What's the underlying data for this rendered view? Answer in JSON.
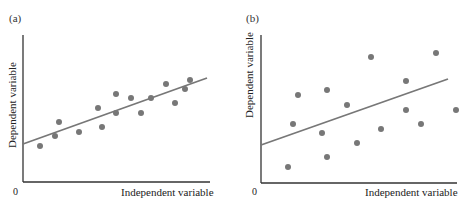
{
  "chart_data": [
    {
      "type": "scatter",
      "panel_label": "(a)",
      "xlabel": "Independent variable",
      "ylabel": "Dependent variable",
      "origin_label": "0",
      "ticks": false,
      "grid": false,
      "point_color": "#777777",
      "line_color": "#777777",
      "axis_color": "#333333",
      "points_px": [
        [
          40,
          146
        ],
        [
          55,
          136
        ],
        [
          59,
          122
        ],
        [
          79,
          132
        ],
        [
          98,
          108
        ],
        [
          102,
          127
        ],
        [
          116,
          94
        ],
        [
          116,
          113
        ],
        [
          131,
          98
        ],
        [
          141,
          113
        ],
        [
          151,
          98
        ],
        [
          166,
          84
        ],
        [
          175,
          103
        ],
        [
          185,
          89
        ],
        [
          190,
          80
        ]
      ],
      "fit_line_px": [
        [
          23,
          144
        ],
        [
          207,
          78
        ]
      ],
      "axes_px": {
        "x0": 23,
        "y0": 182,
        "ytop": 35,
        "xright": 210
      },
      "description": "Points closely clustered around upward-sloping regression line (strong positive correlation)"
    },
    {
      "type": "scatter",
      "panel_label": "(b)",
      "xlabel": "Independent variable",
      "ylabel": "Dependent variable",
      "origin_label": "0",
      "ticks": false,
      "grid": false,
      "point_color": "#777777",
      "line_color": "#777777",
      "axis_color": "#333333",
      "points_px": [
        [
          288,
          167
        ],
        [
          293,
          124
        ],
        [
          298,
          95
        ],
        [
          322,
          133
        ],
        [
          327,
          157
        ],
        [
          327,
          90
        ],
        [
          347,
          105
        ],
        [
          357,
          143
        ],
        [
          371,
          57
        ],
        [
          381,
          129
        ],
        [
          406,
          81
        ],
        [
          406,
          110
        ],
        [
          421,
          124
        ],
        [
          436,
          53
        ],
        [
          456,
          110
        ]
      ],
      "fit_line_px": [
        [
          261,
          145
        ],
        [
          448,
          79
        ]
      ],
      "axes_px": {
        "x0": 261,
        "y0": 183,
        "ytop": 35,
        "xright": 457
      },
      "description": "Points widely scattered around upward-sloping regression line (weak positive correlation)"
    }
  ],
  "panels": {
    "a": {
      "label": "(a)",
      "xlabel": "Independent variable",
      "ylabel": "Dependent variable",
      "origin": "0"
    },
    "b": {
      "label": "(b)",
      "xlabel": "Independent variable",
      "ylabel": "Dependent variable",
      "origin": "0"
    }
  }
}
